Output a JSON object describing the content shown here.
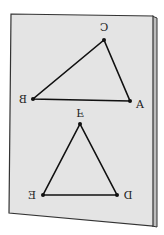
{
  "diagram": {
    "colors": {
      "background": "#ffffff",
      "paper": "#e4e4e4",
      "paper_edge": "#333333",
      "spine": "#bdbdbd",
      "lines": "#111111"
    },
    "triangles": [
      {
        "name": "ABC",
        "vertices": [
          {
            "label": "A",
            "x": 130,
            "y": 101,
            "lx": 140,
            "ly": 108,
            "mirrored": false
          },
          {
            "label": "B",
            "x": 33,
            "y": 99,
            "lx": 23,
            "ly": 103,
            "mirrored": true
          },
          {
            "label": "C",
            "x": 104,
            "y": 40,
            "lx": 104,
            "ly": 31,
            "mirrored": true
          }
        ]
      },
      {
        "name": "DEF",
        "vertices": [
          {
            "label": "D",
            "x": 117,
            "y": 195,
            "lx": 128,
            "ly": 199,
            "mirrored": true
          },
          {
            "label": "E",
            "x": 43,
            "y": 195,
            "lx": 32,
            "ly": 199,
            "mirrored": true
          },
          {
            "label": "F",
            "x": 80,
            "y": 124,
            "lx": 80,
            "ly": 113,
            "mirrored": true,
            "flipped_vertical": true
          }
        ]
      }
    ],
    "labels": {
      "A": "A",
      "B": "B",
      "C": "C",
      "D": "D",
      "E": "E",
      "F": "F"
    }
  }
}
